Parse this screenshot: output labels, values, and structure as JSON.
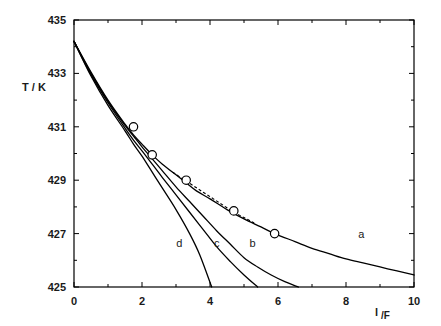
{
  "chart_data": {
    "type": "line",
    "title": "",
    "xlabel": "l /F",
    "ylabel": "T / K",
    "xlim": [
      0,
      10
    ],
    "ylim": [
      425,
      435
    ],
    "xticks": [
      0,
      2,
      4,
      6,
      8,
      10
    ],
    "xticklabels": [
      "0",
      "2",
      "4",
      "6",
      "8",
      "10"
    ],
    "xminorticks": [
      1,
      3,
      5,
      7,
      9
    ],
    "yticks": [
      425,
      427,
      429,
      431,
      433,
      435
    ],
    "yticklabels": [
      "425",
      "427",
      "429",
      "431",
      "433",
      "435"
    ],
    "yminorticks": [
      426,
      428,
      430,
      432,
      434
    ],
    "grid": false,
    "legend": "inline-curve-labels",
    "series": [
      {
        "name": "a",
        "label": "a",
        "label_x": 8.45,
        "label_y": 426.85,
        "style": "solid",
        "x": [
          0,
          0.5,
          1.0,
          1.5,
          1.75,
          2.0,
          2.3,
          2.6,
          3.0,
          3.3,
          3.6,
          4.0,
          4.5,
          5.0,
          5.5,
          5.9,
          6.5,
          7.0,
          7.5,
          8.0,
          8.5,
          9.0,
          9.5,
          10.0
        ],
        "y": [
          434.2,
          433.05,
          432.0,
          431.1,
          430.7,
          430.35,
          429.95,
          429.6,
          429.2,
          428.9,
          428.6,
          428.3,
          427.9,
          427.55,
          427.25,
          427.0,
          426.7,
          426.45,
          426.25,
          426.05,
          425.9,
          425.75,
          425.6,
          425.45
        ]
      },
      {
        "name": "b",
        "label": "b",
        "label_x": 5.25,
        "label_y": 426.5,
        "style": "solid",
        "x": [
          0,
          0.5,
          1.0,
          1.5,
          1.75,
          2.0,
          2.3,
          2.6,
          3.0,
          3.4,
          3.8,
          4.2,
          4.6,
          5.0,
          5.4,
          5.8,
          6.2,
          6.6
        ],
        "y": [
          434.2,
          433.0,
          431.95,
          431.05,
          430.65,
          430.25,
          429.8,
          429.35,
          428.75,
          428.2,
          427.65,
          427.1,
          426.6,
          426.1,
          425.75,
          425.45,
          425.2,
          425.0
        ]
      },
      {
        "name": "c",
        "label": "c",
        "label_x": 4.2,
        "label_y": 426.5,
        "style": "solid",
        "x": [
          0,
          0.5,
          1.0,
          1.5,
          1.75,
          2.0,
          2.3,
          2.6,
          3.0,
          3.4,
          3.8,
          4.2,
          4.6,
          5.0,
          5.4
        ],
        "y": [
          434.2,
          432.95,
          431.9,
          430.95,
          430.5,
          430.1,
          429.6,
          429.1,
          428.45,
          427.8,
          427.15,
          426.5,
          425.95,
          425.45,
          425.0
        ]
      },
      {
        "name": "d",
        "label": "d",
        "label_x": 3.1,
        "label_y": 426.5,
        "style": "solid",
        "x": [
          0,
          0.5,
          1.0,
          1.5,
          1.75,
          2.0,
          2.3,
          2.6,
          3.0,
          3.4,
          3.7,
          4.05
        ],
        "y": [
          434.2,
          432.9,
          431.8,
          430.85,
          430.35,
          429.9,
          429.3,
          428.7,
          427.9,
          427.0,
          426.2,
          425.0
        ]
      },
      {
        "name": "dashed-overlay",
        "label": "",
        "style": "dashed",
        "x": [
          2.9,
          3.2,
          3.5,
          3.8,
          4.1,
          4.4,
          4.7,
          5.0,
          5.3
        ],
        "y": [
          429.3,
          429.05,
          428.8,
          428.55,
          428.3,
          428.05,
          427.8,
          427.6,
          427.4
        ]
      }
    ],
    "markers": [
      {
        "x": 1.75,
        "y": 431.0,
        "shape": "open-circle"
      },
      {
        "x": 2.3,
        "y": 429.95,
        "shape": "open-circle"
      },
      {
        "x": 3.3,
        "y": 429.0,
        "shape": "open-circle"
      },
      {
        "x": 4.7,
        "y": 427.85,
        "shape": "open-circle"
      },
      {
        "x": 5.9,
        "y": 427.0,
        "shape": "open-circle"
      }
    ]
  },
  "axes": {
    "x_title": "l /F",
    "x_title_main": "l",
    "x_title_sub": "/F",
    "y_title": "T / K"
  }
}
